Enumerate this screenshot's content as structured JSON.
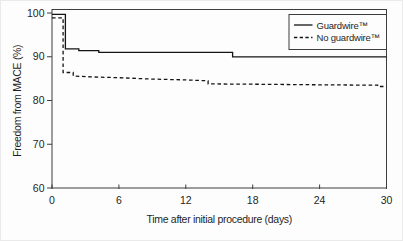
{
  "figure": {
    "background": "#fdfdfd",
    "frame_color": "#3d3d3d",
    "curve_color": "#141414",
    "text_color": "#1f1f1f"
  },
  "chart_data": {
    "type": "line",
    "subtype": "kaplan-meier-step",
    "title": "",
    "xlabel": "Time after initial procedure (days)",
    "ylabel": "Freedom from MACE (%)",
    "xlim": [
      0,
      30
    ],
    "ylim": [
      60,
      100.8
    ],
    "x_ticks": [
      0,
      6,
      12,
      18,
      24,
      30
    ],
    "y_ticks": [
      60,
      70,
      80,
      90,
      100
    ],
    "grid": false,
    "frame": "full-box",
    "legend_position": "top-right",
    "series": [
      {
        "name": "Guardwire™",
        "style": "solid",
        "final_value": 90.0,
        "points": [
          [
            0,
            99.7
          ],
          [
            1.2,
            99.7
          ],
          [
            1.2,
            91.8
          ],
          [
            2.4,
            91.8
          ],
          [
            2.4,
            91.4
          ],
          [
            4.2,
            91.4
          ],
          [
            4.2,
            91.0
          ],
          [
            16.2,
            91.0
          ],
          [
            16.2,
            90.0
          ],
          [
            30,
            90.0
          ]
        ]
      },
      {
        "name": "No guardwire™",
        "style": "dashed",
        "final_value": 83.2,
        "points": [
          [
            0,
            98.9
          ],
          [
            1.0,
            98.9
          ],
          [
            1.0,
            86.4
          ],
          [
            1.9,
            86.4
          ],
          [
            1.9,
            85.6
          ],
          [
            3.5,
            85.4
          ],
          [
            6,
            85.2
          ],
          [
            9,
            84.9
          ],
          [
            12,
            84.7
          ],
          [
            14,
            84.5
          ],
          [
            14,
            83.8
          ],
          [
            19,
            83.7
          ],
          [
            24,
            83.6
          ],
          [
            29.2,
            83.5
          ],
          [
            29.2,
            83.2
          ],
          [
            30,
            83.2
          ]
        ]
      }
    ]
  }
}
